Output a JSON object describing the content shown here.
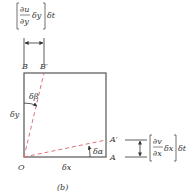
{
  "diagram": {
    "caption": "(b)",
    "points": {
      "origin": "O",
      "a": "A",
      "a_prime": "A′",
      "b": "B",
      "b_prime": "B′"
    },
    "sides": {
      "horizontal": "δx",
      "vertical": "δy"
    },
    "angles": {
      "alpha": "δα",
      "beta": "δβ"
    },
    "top_expression": {
      "numerator": "∂u",
      "denominator": "∂y",
      "factor": "δy",
      "time": "δt"
    },
    "right_expression": {
      "numerator": "∂v",
      "denominator": "∂x",
      "factor": "δx",
      "time": "δt"
    },
    "colors": {
      "square": "#555555",
      "dashed": "#e0707a",
      "text": "#333333"
    }
  }
}
